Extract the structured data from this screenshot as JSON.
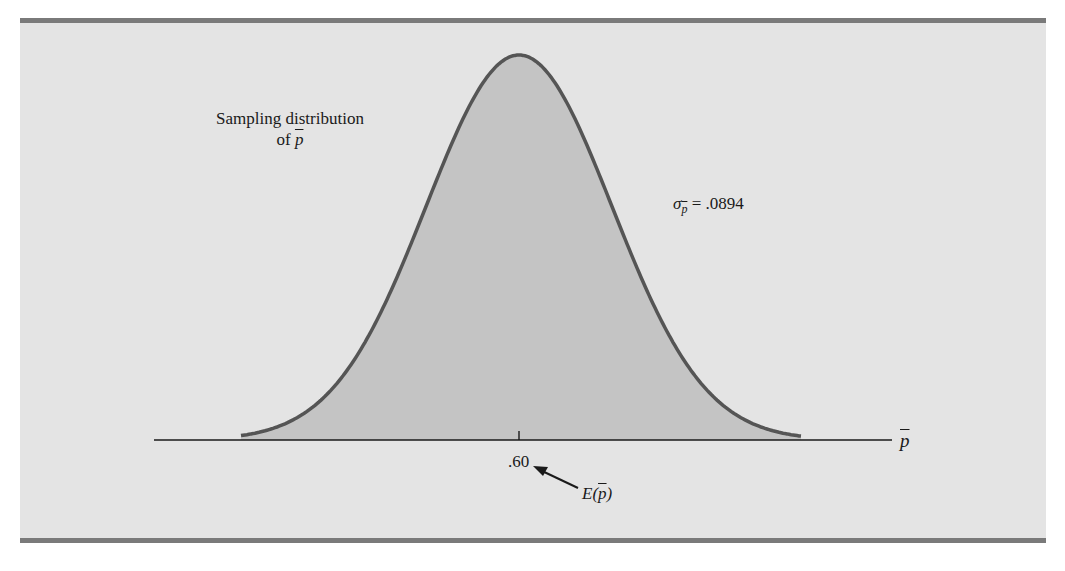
{
  "chart_data": {
    "type": "area",
    "distribution": "normal",
    "mean": 0.6,
    "std_error": 0.0894,
    "xlabel": "p̄",
    "ylabel": "",
    "x_ticks": [
      ".60"
    ],
    "annotations": [
      {
        "text": "Sampling distribution of p̄",
        "position": "upper-left"
      },
      {
        "text": "σp̄ = .0894",
        "position": "right of curve"
      },
      {
        "text": "E(p̄)",
        "arrow_to": ".60"
      }
    ],
    "grid": false,
    "legend": "none"
  },
  "labels": {
    "title_line1": "Sampling distribution",
    "title_line2_prefix": "of ",
    "p": "p",
    "sigma": "σ",
    "sigma_value": " = .0894",
    "tick": ".60",
    "axis_label": "p",
    "expect_E": "E(",
    "expect_close": ")"
  },
  "colors": {
    "panel": "#e4e4e4",
    "fill": "#c4c4c4",
    "curve": "#555555",
    "bar": "#7a7a7a",
    "axis": "#1a1a1a"
  }
}
